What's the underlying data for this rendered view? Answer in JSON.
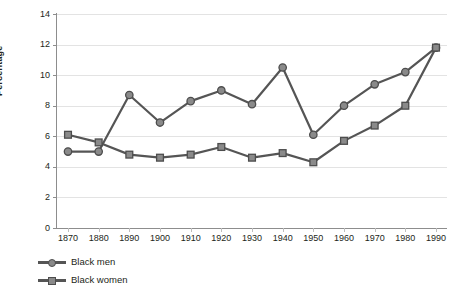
{
  "chart_data": {
    "type": "line",
    "title": "",
    "xlabel": "",
    "ylabel": "Percentage",
    "categories": [
      1870,
      1880,
      1890,
      1900,
      1910,
      1920,
      1930,
      1940,
      1950,
      1960,
      1970,
      1980,
      1990
    ],
    "x_tick_labels": [
      "1870",
      "1880",
      "1890",
      "1900",
      "1910",
      "1920",
      "1930",
      "1940",
      "1950",
      "1960",
      "1970",
      "1980",
      "1990"
    ],
    "y_tick_labels": [
      "0",
      "2",
      "4",
      "6",
      "8",
      "10",
      "12",
      "14"
    ],
    "y_ticks": [
      0,
      2,
      4,
      6,
      8,
      10,
      12,
      14
    ],
    "ylim": [
      0,
      14
    ],
    "xlim": [
      1870,
      1990
    ],
    "grid": true,
    "grid_axis": "y",
    "legend_position": "bottom-left",
    "series": [
      {
        "name": "Black men",
        "marker": "circle",
        "color": "#555555",
        "marker_fill": "#8a8a8a",
        "values": [
          5.0,
          5.0,
          8.7,
          6.9,
          8.3,
          9.0,
          8.1,
          10.5,
          6.1,
          8.0,
          9.4,
          10.2,
          11.8
        ]
      },
      {
        "name": "Black women",
        "marker": "square",
        "color": "#555555",
        "marker_fill": "#8a8a8a",
        "values": [
          6.1,
          5.6,
          4.8,
          4.6,
          4.8,
          5.3,
          4.6,
          4.9,
          4.3,
          5.7,
          6.7,
          8.0,
          11.8
        ]
      }
    ]
  },
  "legend": {
    "items": [
      {
        "label": "Black men",
        "marker": "circle"
      },
      {
        "label": "Black women",
        "marker": "square"
      }
    ]
  },
  "colors": {
    "line": "#555555",
    "marker_fill": "#8a8a8a",
    "marker_edge": "#4d4d4d",
    "grid": "#e3e3e3",
    "axis": "#8d8d8d",
    "text": "#231f20",
    "background": "#ffffff"
  }
}
